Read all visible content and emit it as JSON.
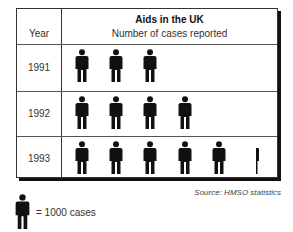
{
  "chart_data": {
    "type": "pictogram",
    "title": "Aids in the UK",
    "subtitle": "Number of cases reported",
    "column_header": "Year",
    "categories": [
      "1991",
      "1992",
      "1993"
    ],
    "icons": [
      3,
      4,
      5.2
    ],
    "values": [
      3000,
      4000,
      5200
    ],
    "unit_per_icon": 1000,
    "legend": "= 1000 cases",
    "source": "Source: HMSO statistics"
  },
  "table": {
    "year_header": "Year",
    "title": "Aids in the UK",
    "subtitle": "Number of cases reported",
    "rows": [
      {
        "year": "1991"
      },
      {
        "year": "1992"
      },
      {
        "year": "1993"
      }
    ]
  },
  "source": "Source: HMSO statistics",
  "legend": {
    "icon": "person-icon",
    "text": "= 1000 cases"
  },
  "colors": {
    "figure": "#111111",
    "border": "#333333"
  }
}
